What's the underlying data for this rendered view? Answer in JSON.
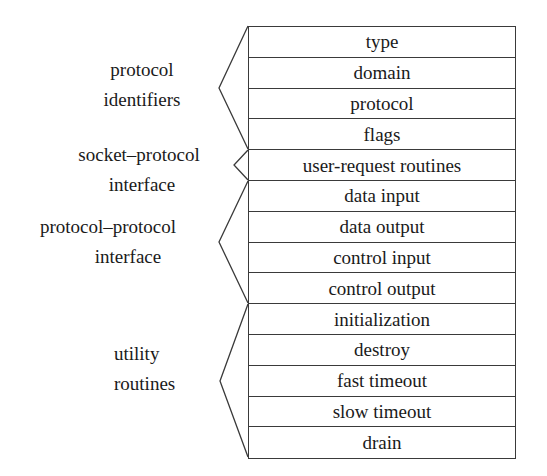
{
  "diagram": {
    "rows": [
      "type",
      "domain",
      "protocol",
      "flags",
      "user-request routines",
      "data input",
      "data output",
      "control input",
      "control output",
      "initialization",
      "destroy",
      "fast timeout",
      "slow timeout",
      "drain"
    ],
    "groups": [
      {
        "lines": [
          "protocol",
          "identifiers"
        ],
        "rows_from": 0,
        "rows_to": 3
      },
      {
        "lines": [
          "socket–protocol",
          "interface"
        ],
        "rows_from": 4,
        "rows_to": 4
      },
      {
        "lines": [
          "protocol–protocol",
          "interface"
        ],
        "rows_from": 5,
        "rows_to": 8
      },
      {
        "lines": [
          "utility",
          "routines"
        ],
        "rows_from": 9,
        "rows_to": 13
      }
    ],
    "colors": {
      "line": "#3a3a3a",
      "text": "#1a1a1a",
      "background": "#ffffff"
    }
  }
}
